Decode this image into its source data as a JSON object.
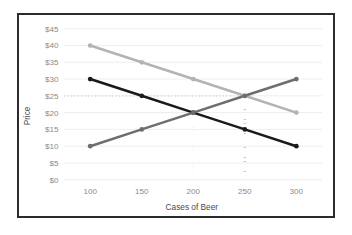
{
  "chart_data": {
    "type": "line",
    "title": "",
    "xlabel": "Cases of Beer",
    "ylabel": "Price",
    "x": [
      100,
      150,
      200,
      250,
      300
    ],
    "xtick_labels": [
      "100",
      "150",
      "200",
      "250",
      "300"
    ],
    "ytick_values": [
      0,
      5,
      10,
      15,
      20,
      25,
      30,
      35,
      40,
      45
    ],
    "ytick_labels": [
      "$0",
      "$5",
      "$10",
      "$15",
      "$20",
      "$25",
      "$30",
      "$35",
      "$40",
      "$45"
    ],
    "ylim": [
      0,
      45
    ],
    "xlim": [
      75,
      325
    ],
    "grid": "horizontal",
    "legend": "none",
    "series": [
      {
        "name": "high-demand-curve",
        "color": "#b3b3b3",
        "values": [
          40,
          35,
          30,
          25,
          20
        ]
      },
      {
        "name": "low-demand-curve",
        "color": "#1a1a1a",
        "values": [
          30,
          25,
          20,
          15,
          10
        ]
      },
      {
        "name": "supply-curve",
        "color": "#6e6e6e",
        "values": [
          10,
          15,
          20,
          25,
          30
        ]
      }
    ],
    "annotations": [
      {
        "name": "equilibrium-low-demand",
        "x": 200,
        "y": 20,
        "style": "light-dotted",
        "color": "#bfbfbf",
        "horizontal_from_axis": true,
        "vertical_to_axis": true
      },
      {
        "name": "equilibrium-high-demand",
        "x": 250,
        "y": 25,
        "style": "bold-dotted",
        "color": "#111111",
        "horizontal_from_axis": true,
        "vertical_to_axis": true
      }
    ]
  },
  "axes": {
    "y_title": "Price",
    "x_title": "Cases of Beer"
  }
}
